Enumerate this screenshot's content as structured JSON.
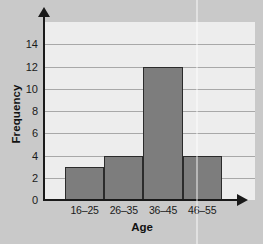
{
  "chart_data": {
    "type": "bar",
    "title": "",
    "xlabel": "Age",
    "ylabel": "Frequency",
    "categories": [
      "16–25",
      "26–35",
      "36–45",
      "46–55"
    ],
    "values": [
      3,
      4,
      12,
      4
    ],
    "yticks": [
      0,
      2,
      4,
      6,
      8,
      10,
      12,
      14
    ],
    "ytick_labels": [
      "0",
      "2",
      "4",
      "6",
      "8",
      "10",
      "12",
      "14"
    ],
    "ylim": [
      0,
      16
    ],
    "grid": "horizontal",
    "legend": "none",
    "series": [
      {
        "name": "Frequency",
        "values": [
          3,
          4,
          12,
          4
        ]
      }
    ],
    "colors": {
      "bar_fill": "#7d7d7d",
      "bar_edge": "#2b2b2b",
      "panel_background": "#ededed",
      "figure_background": "#c9c9c9",
      "gridline": "#a8a8a8",
      "axis": "#1a1a1a",
      "text": "#1a1a1a"
    }
  }
}
